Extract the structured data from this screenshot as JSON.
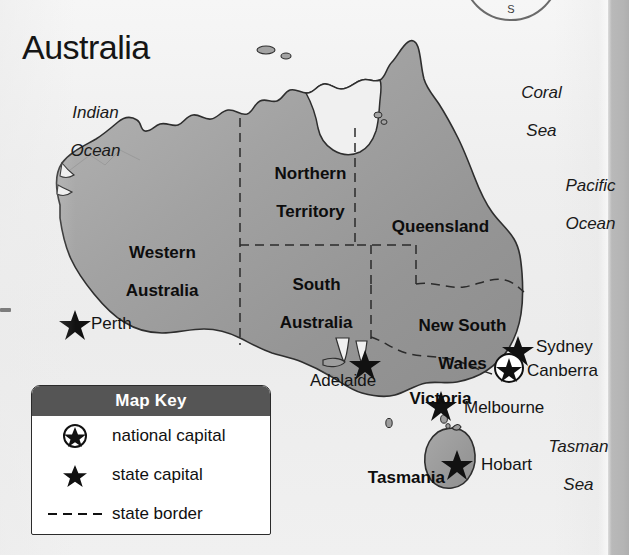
{
  "map": {
    "title": "Australia",
    "compass": {
      "south_label": "S"
    },
    "oceans": [
      {
        "id": "indian-ocean",
        "line1": "Indian",
        "line2": "Ocean"
      },
      {
        "id": "coral-sea",
        "line1": "Coral",
        "line2": "Sea"
      },
      {
        "id": "pacific-ocean",
        "line1": "Pacific",
        "line2": "Ocean"
      },
      {
        "id": "tasman-sea",
        "line1": "Tasman",
        "line2": "Sea"
      }
    ],
    "states": [
      {
        "id": "western-australia",
        "line1": "Western",
        "line2": "Australia"
      },
      {
        "id": "northern-territory",
        "line1": "Northern",
        "line2": "Territory"
      },
      {
        "id": "south-australia",
        "line1": "South",
        "line2": "Australia"
      },
      {
        "id": "queensland",
        "line1": "Queensland",
        "line2": ""
      },
      {
        "id": "new-south-wales",
        "line1": "New South",
        "line2": "Wales"
      },
      {
        "id": "victoria",
        "line1": "Victoria",
        "line2": ""
      },
      {
        "id": "tasmania",
        "line1": "Tasmania",
        "line2": ""
      }
    ],
    "cities": [
      {
        "id": "perth",
        "name": "Perth",
        "type": "state capital"
      },
      {
        "id": "adelaide",
        "name": "Adelaide",
        "type": "state capital"
      },
      {
        "id": "melbourne",
        "name": "Melbourne",
        "type": "state capital"
      },
      {
        "id": "hobart",
        "name": "Hobart",
        "type": "state capital"
      },
      {
        "id": "sydney",
        "name": "Sydney",
        "type": "state capital"
      },
      {
        "id": "canberra",
        "name": "Canberra",
        "type": "national capital"
      }
    ],
    "colors": {
      "land": "#9a9a9a",
      "land_light": "#b9b9b9",
      "coast_line": "#2f2f2f",
      "legend_header": "#555555",
      "paper": "#f0f0f0",
      "text": "#111111"
    }
  },
  "legend": {
    "title": "Map Key",
    "rows": [
      {
        "symbol": "circled-star-icon",
        "label": "national capital"
      },
      {
        "symbol": "star-icon",
        "label": "state capital"
      },
      {
        "symbol": "dashed-line-icon",
        "label": "state border"
      }
    ]
  }
}
